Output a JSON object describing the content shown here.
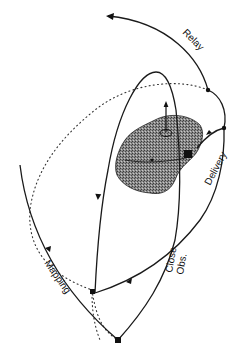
{
  "diagram": {
    "labels": {
      "relay": "Relay",
      "delivery": "Delivery",
      "close_obs_line1": "Close",
      "close_obs_line2": "Obs.",
      "mapping": "Mapping"
    },
    "colors": {
      "ink": "#1a1a1a",
      "asteroid_fill": "#7a7a7a",
      "background": "#ffffff"
    }
  }
}
